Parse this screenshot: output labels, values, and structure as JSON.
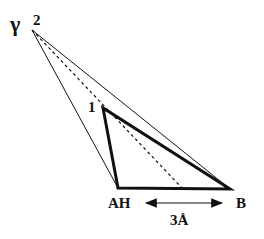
{
  "labels": {
    "gamma": "γ",
    "point2": "2",
    "point1": "1",
    "ah": "AH",
    "b": "B",
    "distance": "3Å"
  },
  "points": {
    "p2": [
      32,
      30
    ],
    "p1": [
      103,
      108
    ],
    "ah": [
      118,
      188
    ],
    "b": [
      230,
      189
    ],
    "dash_end": [
      182,
      188
    ]
  },
  "colors": {
    "line": "#111111",
    "background": "#ffffff"
  }
}
